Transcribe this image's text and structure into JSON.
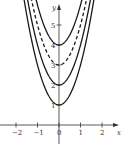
{
  "chart_data": {
    "type": "line",
    "title": "",
    "xlabel": "x",
    "ylabel": "y",
    "x_ticks": [
      -2,
      -1,
      0,
      1,
      2
    ],
    "x_tick_labels": [
      "−2",
      "−1",
      "0",
      "1",
      "2"
    ],
    "y_ticks": [
      1,
      2,
      3,
      4,
      5
    ],
    "y_tick_labels": [
      "1",
      "2",
      "3",
      "4",
      "5"
    ],
    "xlim": [
      -2.7,
      2.75
    ],
    "ylim": [
      0,
      6.25
    ],
    "grid": false,
    "series": [
      {
        "name": "C = 1",
        "C": 1,
        "style": "solid"
      },
      {
        "name": "C = 2",
        "C": 2,
        "style": "solid"
      },
      {
        "name": "C = 3",
        "C": 3,
        "style": "dashed"
      },
      {
        "name": "C = 4",
        "C": 4,
        "style": "solid"
      }
    ]
  },
  "colors": {
    "curve": "#1a1a1a",
    "axis": "#333333"
  }
}
